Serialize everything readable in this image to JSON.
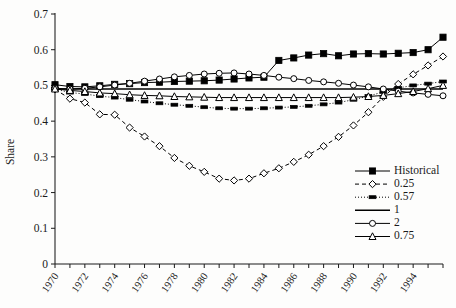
{
  "chart_data": {
    "type": "line",
    "title": "",
    "xlabel": "",
    "ylabel": "Share",
    "xlim": [
      1970,
      1996
    ],
    "ylim": [
      0,
      0.7
    ],
    "ytick_labels": [
      "0",
      "0.1",
      "0.2",
      "0.3",
      "0.4",
      "0.5",
      "0.6",
      "0.7"
    ],
    "ytick_values": [
      0,
      0.1,
      0.2,
      0.3,
      0.4,
      0.5,
      0.6,
      0.7
    ],
    "xtick_labels": [
      "1970",
      "1972",
      "1974",
      "1976",
      "1978",
      "1980",
      "1982",
      "1984",
      "1986",
      "1988",
      "1990",
      "1992",
      "1994"
    ],
    "xtick_values": [
      1970,
      1972,
      1974,
      1976,
      1978,
      1980,
      1982,
      1984,
      1986,
      1988,
      1990,
      1992,
      1994
    ],
    "minor_xticks": [
      1970,
      1971,
      1972,
      1973,
      1974,
      1975,
      1976,
      1977,
      1978,
      1979,
      1980,
      1981,
      1982,
      1983,
      1984,
      1985,
      1986,
      1987,
      1988,
      1989,
      1990,
      1991,
      1992,
      1993,
      1994,
      1995,
      1996
    ],
    "grid": false,
    "legend_position": "lower-right",
    "x": [
      1970,
      1971,
      1972,
      1973,
      1974,
      1975,
      1976,
      1977,
      1978,
      1979,
      1980,
      1981,
      1982,
      1983,
      1984,
      1985,
      1986,
      1987,
      1988,
      1989,
      1990,
      1991,
      1992,
      1993,
      1994,
      1995,
      1996
    ],
    "series": [
      {
        "name": "Historical",
        "marker": "filled-square",
        "dash": "solid",
        "color": "#000000",
        "values": [
          0.502,
          0.497,
          0.496,
          0.499,
          0.503,
          0.505,
          0.508,
          0.509,
          0.511,
          0.512,
          0.513,
          0.515,
          0.518,
          0.521,
          0.523,
          0.57,
          0.577,
          0.585,
          0.589,
          0.583,
          0.588,
          0.589,
          0.588,
          0.59,
          0.592,
          0.6,
          0.635
        ]
      },
      {
        "name": "0.25",
        "marker": "open-diamond",
        "dash": "dashed",
        "color": "#000000",
        "values": [
          0.489,
          0.463,
          0.452,
          0.419,
          0.418,
          0.382,
          0.357,
          0.33,
          0.297,
          0.275,
          0.258,
          0.239,
          0.234,
          0.239,
          0.254,
          0.268,
          0.286,
          0.306,
          0.33,
          0.356,
          0.388,
          0.425,
          0.468,
          0.504,
          0.531,
          0.556,
          0.581
        ]
      },
      {
        "name": "0.57",
        "marker": "filled-square-small",
        "dash": "dashdot",
        "color": "#000000",
        "values": [
          0.49,
          0.48,
          0.476,
          0.47,
          0.466,
          0.46,
          0.455,
          0.45,
          0.446,
          0.443,
          0.439,
          0.436,
          0.435,
          0.435,
          0.436,
          0.438,
          0.44,
          0.443,
          0.447,
          0.452,
          0.46,
          0.47,
          0.482,
          0.493,
          0.5,
          0.505,
          0.511
        ]
      },
      {
        "name": "1",
        "marker": "none",
        "dash": "solid",
        "color": "#000000",
        "values": [
          0.49,
          0.49,
          0.49,
          0.49,
          0.49,
          0.49,
          0.49,
          0.49,
          0.49,
          0.49,
          0.49,
          0.49,
          0.49,
          0.49,
          0.49,
          0.49,
          0.49,
          0.49,
          0.49,
          0.49,
          0.49,
          0.49,
          0.49,
          0.49,
          0.49,
          0.49,
          0.49
        ]
      },
      {
        "name": "2",
        "marker": "open-circle",
        "dash": "solid",
        "color": "#000000",
        "values": [
          0.492,
          0.49,
          0.492,
          0.496,
          0.501,
          0.506,
          0.512,
          0.518,
          0.524,
          0.528,
          0.532,
          0.534,
          0.535,
          0.532,
          0.528,
          0.523,
          0.519,
          0.514,
          0.51,
          0.506,
          0.501,
          0.496,
          0.49,
          0.484,
          0.479,
          0.475,
          0.471
        ]
      },
      {
        "name": "0.75",
        "marker": "open-triangle",
        "dash": "solid",
        "color": "#000000",
        "values": [
          0.49,
          0.486,
          0.483,
          0.479,
          0.477,
          0.474,
          0.472,
          0.471,
          0.469,
          0.468,
          0.467,
          0.466,
          0.466,
          0.466,
          0.466,
          0.466,
          0.466,
          0.466,
          0.466,
          0.466,
          0.467,
          0.469,
          0.472,
          0.477,
          0.483,
          0.491,
          0.5
        ]
      }
    ],
    "legend_entries": [
      {
        "label": "Historical",
        "marker": "filled-square",
        "dash": "solid"
      },
      {
        "label": "0.25",
        "marker": "open-diamond",
        "dash": "dashed"
      },
      {
        "label": "0.57",
        "marker": "filled-square-small",
        "dash": "dashdot"
      },
      {
        "label": "1",
        "marker": "none",
        "dash": "solid"
      },
      {
        "label": "2",
        "marker": "open-circle",
        "dash": "solid"
      },
      {
        "label": "0.75",
        "marker": "open-triangle",
        "dash": "solid"
      }
    ]
  }
}
